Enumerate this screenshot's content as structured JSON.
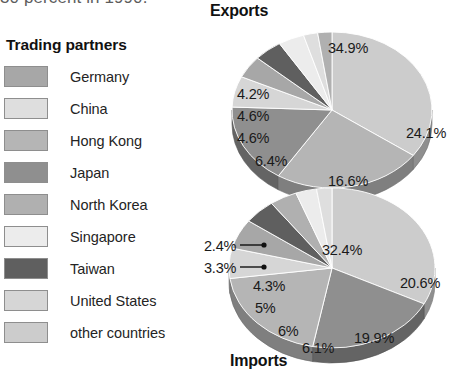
{
  "page": {
    "cut_off_text": "30 percent in 1990."
  },
  "legend": {
    "title": "Trading partners",
    "items": [
      {
        "label": "Germany",
        "color": "#a7a7a7",
        "key": "germany"
      },
      {
        "label": "China",
        "color": "#dedede",
        "key": "china"
      },
      {
        "label": "Hong Kong",
        "color": "#b5b5b5",
        "key": "hong-kong"
      },
      {
        "label": "Japan",
        "color": "#8f8f8f",
        "key": "japan"
      },
      {
        "label": "North Korea",
        "color": "#b0b0b0",
        "key": "north-korea"
      },
      {
        "label": "Singapore",
        "color": "#ececec",
        "key": "singapore"
      },
      {
        "label": "Taiwan",
        "color": "#5f5f5f",
        "key": "taiwan"
      },
      {
        "label": "United States",
        "color": "#d6d6d6",
        "key": "united-states"
      },
      {
        "label": "other countries",
        "color": "#cccccc",
        "key": "other-countries"
      }
    ]
  },
  "charts": {
    "exports": {
      "title": "Exports",
      "labels": [
        {
          "text": "34.9%",
          "x": 118,
          "y": 22
        },
        {
          "text": "24.1%",
          "x": 196,
          "y": 107
        },
        {
          "text": "16.6%",
          "x": 118,
          "y": 155
        },
        {
          "text": "6.4%",
          "x": 45,
          "y": 135
        },
        {
          "text": "4.6%",
          "x": 27,
          "y": 112
        },
        {
          "text": "4.6%",
          "x": 27,
          "y": 90
        },
        {
          "text": "4.2%",
          "x": 27,
          "y": 68
        }
      ]
    },
    "imports": {
      "title": "Imports",
      "labels": [
        {
          "text": "32.4%",
          "x": 120,
          "y": 62
        },
        {
          "text": "20.6%",
          "x": 198,
          "y": 95
        },
        {
          "text": "19.9%",
          "x": 152,
          "y": 150
        },
        {
          "text": "6.1%",
          "x": 100,
          "y": 160
        },
        {
          "text": "6%",
          "x": 76,
          "y": 143
        },
        {
          "text": "5%",
          "x": 53,
          "y": 120
        },
        {
          "text": "4.3%",
          "x": 51,
          "y": 98
        },
        {
          "text": "3.3%",
          "x": 2,
          "y": 80
        },
        {
          "text": "2.4%",
          "x": 2,
          "y": 58
        }
      ]
    }
  },
  "chart_data": [
    {
      "type": "pie",
      "title": "Exports",
      "unit": "percent",
      "legend_position": "left",
      "categories": [
        "other countries",
        "Hong Kong",
        "Japan",
        "United States",
        "Germany",
        "Taiwan",
        "Singapore",
        "China",
        "North Korea"
      ],
      "values": [
        34.9,
        24.1,
        16.6,
        6.4,
        4.6,
        4.6,
        4.2,
        2.3,
        2.3
      ],
      "labels_shown": [
        "34.9%",
        "24.1%",
        "16.6%",
        "6.4%",
        "4.6%",
        "4.6%",
        "4.2%"
      ],
      "xlabel": "",
      "ylabel": ""
    },
    {
      "type": "pie",
      "title": "Imports",
      "unit": "percent",
      "legend_position": "left",
      "categories": [
        "other countries",
        "Japan",
        "Hong Kong",
        "United States",
        "Germany",
        "Taiwan",
        "North Korea",
        "Singapore",
        "China"
      ],
      "values": [
        32.4,
        20.6,
        19.9,
        6.1,
        6.0,
        5.0,
        4.3,
        3.3,
        2.4
      ],
      "labels_shown": [
        "32.4%",
        "20.6%",
        "19.9%",
        "6.1%",
        "6%",
        "5%",
        "4.3%",
        "3.3%",
        "2.4%"
      ],
      "xlabel": "",
      "ylabel": ""
    }
  ]
}
